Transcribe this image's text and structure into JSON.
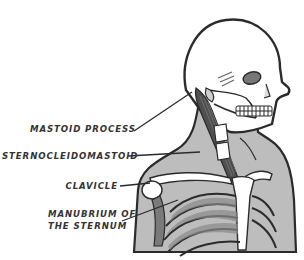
{
  "diagram": {
    "type": "anatomical-illustration",
    "labels": [
      {
        "id": "mastoid",
        "text": "MASTOID PROCESS"
      },
      {
        "id": "scm",
        "text": "STERNOCLEIDOMASTOID"
      },
      {
        "id": "clavicle",
        "text": "CLAVICLE"
      },
      {
        "id": "manubrium_line1",
        "text": "MANUBRIUM OF"
      },
      {
        "id": "manubrium_line2",
        "text": "THE STERNUM"
      }
    ],
    "colors": {
      "outline": "#2b2b2b",
      "skin": "#bdbdbd",
      "bone": "#ffffff",
      "muscle": "#555555",
      "shadow": "#8a8a8a",
      "text": "#333333"
    }
  }
}
